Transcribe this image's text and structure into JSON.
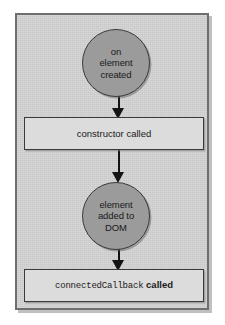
{
  "diagram": {
    "colors": {
      "frame_bg": "#d2d2d2",
      "frame_border": "#6e6e6e",
      "circle_fill": "#9b9b9b",
      "rect_fill": "#dcdcdc",
      "node_border": "#3a3a3a",
      "arrow": "#141414",
      "text": "#1a1a1a"
    },
    "nodes": [
      {
        "id": "on-element-created",
        "shape": "circle",
        "lines": [
          "on",
          "element",
          "created"
        ]
      },
      {
        "id": "constructor-called",
        "shape": "rectangle",
        "text": "constructor called"
      },
      {
        "id": "element-added-to-dom",
        "shape": "circle",
        "lines": [
          "element",
          "added to",
          "DOM"
        ]
      },
      {
        "id": "connected-callback-called",
        "shape": "rectangle",
        "code_text": "connectedCallback",
        "suffix_text": "called"
      }
    ],
    "arrows": [
      {
        "id": "arrow-created-to-constructor",
        "direction": "down"
      },
      {
        "id": "arrow-constructor-to-added",
        "direction": "down"
      },
      {
        "id": "arrow-added-to-connected",
        "direction": "down"
      }
    ]
  }
}
